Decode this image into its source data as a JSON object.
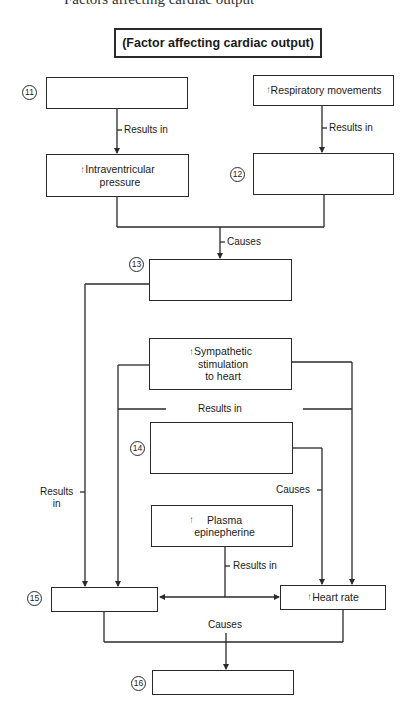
{
  "cut_heading": "Factors affecting cardiac output",
  "title": "(Factor affecting cardiac output)",
  "up_arrow_glyph": "↑",
  "boxes": {
    "box11": {
      "number": "11",
      "text": ""
    },
    "respiratory": {
      "arrow": "↑",
      "text": "Respiratory movements"
    },
    "intraventricular": {
      "arrow": "↑",
      "text": "Intraventricular\npressure"
    },
    "box12": {
      "number": "12",
      "text": ""
    },
    "box13": {
      "number": "13",
      "text": ""
    },
    "sympathetic": {
      "arrow": "↑",
      "text": "Sympathetic\nstimulation\nto heart"
    },
    "box14": {
      "number": "14",
      "text": ""
    },
    "plasma": {
      "arrow": "↑",
      "text": "Plasma\nepinepherine"
    },
    "box15": {
      "number": "15",
      "text": ""
    },
    "heart_rate": {
      "arrow": "↑",
      "text": "Heart rate"
    },
    "box16": {
      "number": "16",
      "text": ""
    }
  },
  "labels": {
    "results_in_left": "Results in",
    "results_in_right": "Results in",
    "causes_top": "Causes",
    "results_in_middle": "Results in",
    "results_in_side": "Results\nin",
    "causes_right": "Causes",
    "results_in_plasma": "Results in",
    "causes_bottom": "Causes"
  },
  "colors": {
    "line": "#2a2a2a",
    "background": "#ffffff"
  }
}
